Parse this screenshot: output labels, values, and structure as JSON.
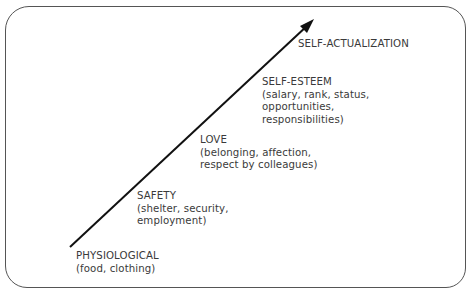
{
  "diagram": {
    "type": "hierarchy-arrow",
    "colors": {
      "line": "#111111",
      "border": "#555555",
      "text": "#3a3a3a"
    },
    "levels": [
      {
        "title": "PHYSIOLOGICAL",
        "lines": [
          "(food, clothing)"
        ]
      },
      {
        "title": "SAFETY",
        "lines": [
          "(shelter, security,",
          "employment)"
        ]
      },
      {
        "title": "LOVE",
        "lines": [
          "(belonging, affection,",
          "respect by colleagues)"
        ]
      },
      {
        "title": "SELF-ESTEEM",
        "lines": [
          "(salary, rank, status,",
          "opportunities,",
          "responsibilities)"
        ]
      },
      {
        "title": "SELF-ACTUALIZATION",
        "lines": []
      }
    ]
  }
}
